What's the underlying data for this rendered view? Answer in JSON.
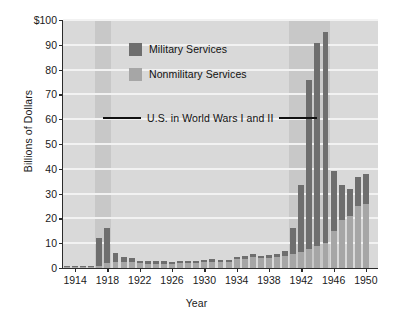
{
  "chart_data": {
    "type": "bar",
    "title": "",
    "xlabel": "Year",
    "ylabel": "Billions of Dollars",
    "stacked": true,
    "grid": "horizontal-white-gridlines",
    "legend_position": "inside-top-left",
    "ylim": [
      0,
      100
    ],
    "ytick_labels": [
      "0",
      "10",
      "20",
      "30",
      "40",
      "50",
      "60",
      "70",
      "80",
      "90",
      "$100"
    ],
    "ytick_values": [
      0,
      10,
      20,
      30,
      40,
      50,
      60,
      70,
      80,
      90,
      100
    ],
    "xtick_labels": [
      "1914",
      "1918",
      "1922",
      "1926",
      "1930",
      "1934",
      "1938",
      "1942",
      "1946",
      "1950"
    ],
    "xtick_values": [
      1914,
      1918,
      1922,
      1926,
      1930,
      1934,
      1938,
      1942,
      1946,
      1950
    ],
    "xlim": [
      1912.5,
      1951.5
    ],
    "categories": [
      1913,
      1914,
      1915,
      1916,
      1917,
      1918,
      1919,
      1920,
      1921,
      1922,
      1923,
      1924,
      1925,
      1926,
      1927,
      1928,
      1929,
      1930,
      1931,
      1932,
      1933,
      1934,
      1935,
      1936,
      1937,
      1938,
      1939,
      1940,
      1941,
      1942,
      1943,
      1944,
      1945,
      1946,
      1947,
      1948,
      1949,
      1950
    ],
    "series": [
      {
        "name": "Nonmilitary Services",
        "color": "#a6a6a6",
        "values": [
          0.5,
          0.5,
          0.5,
          0.6,
          1.0,
          2.0,
          2.5,
          2.5,
          2.5,
          2.0,
          1.8,
          1.8,
          1.8,
          1.8,
          2.0,
          2.0,
          2.2,
          2.5,
          2.6,
          2.4,
          2.6,
          3.6,
          3.8,
          4.6,
          4.0,
          4.2,
          4.6,
          5.0,
          5.6,
          6.3,
          7.5,
          8.8,
          10.0,
          15.0,
          19.5,
          21.0,
          25.0,
          26.0
        ]
      },
      {
        "name": "Military Services",
        "color": "#6e6e6e",
        "values": [
          0.3,
          0.3,
          0.3,
          0.4,
          11.0,
          14.0,
          3.5,
          2.0,
          1.5,
          0.9,
          0.9,
          0.9,
          0.9,
          0.8,
          0.8,
          0.8,
          0.8,
          0.9,
          0.9,
          0.8,
          0.8,
          0.9,
          0.9,
          1.0,
          1.0,
          1.0,
          1.2,
          1.8,
          10.5,
          27.0,
          68.5,
          82.0,
          85.0,
          24.0,
          14.0,
          11.0,
          11.5,
          12.0
        ]
      }
    ],
    "totals": [
      0.8,
      0.8,
      0.8,
      1.0,
      12.0,
      16.0,
      6.0,
      4.5,
      4.0,
      2.9,
      2.7,
      2.7,
      2.7,
      2.6,
      2.8,
      2.8,
      3.0,
      3.4,
      3.5,
      3.2,
      3.4,
      4.5,
      4.7,
      5.6,
      5.0,
      5.2,
      5.8,
      6.8,
      16.1,
      33.3,
      76.0,
      90.8,
      95.0,
      39.0,
      33.5,
      32.0,
      36.5,
      38.0
    ],
    "annotations": [
      {
        "text": "U.S. in World Wars I and II",
        "style": "horizontal-rule-with-centered-label",
        "y_value": 60
      }
    ],
    "shaded_bands": [
      {
        "label": "World War I",
        "from": 1917,
        "to": 1918,
        "color": "#c8c8c8"
      },
      {
        "label": "World War II",
        "from": 1941,
        "to": 1945,
        "color": "#c8c8c8"
      }
    ],
    "plot_background": "#d9d9d9",
    "gridline_color": "#f2f2f2",
    "axis_color": "#2b2b2b"
  },
  "legend": {
    "items": [
      {
        "label": "Military Services",
        "color": "#6e6e6e"
      },
      {
        "label": "Nonmilitary Services",
        "color": "#a6a6a6"
      }
    ]
  },
  "annotation": {
    "war_label": "U.S. in World Wars I and II"
  }
}
